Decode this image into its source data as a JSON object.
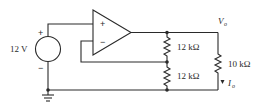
{
  "diagram": {
    "type": "op-amp voltage follower circuit",
    "source": {
      "label": "12 V",
      "plus": "+",
      "minus": "−"
    },
    "opamp": {
      "plus_input": "+",
      "minus_input": "−"
    },
    "resistors": [
      {
        "id": "R1",
        "label": "12 kΩ"
      },
      {
        "id": "R2",
        "label": "12 kΩ"
      },
      {
        "id": "RL",
        "label": "10 kΩ"
      }
    ],
    "output_voltage": {
      "symbol": "V",
      "subscript": "o"
    },
    "output_current": {
      "symbol": "I",
      "subscript": "o"
    },
    "colors": {
      "line": "#2a2a2a",
      "background": "#ffffff"
    }
  }
}
